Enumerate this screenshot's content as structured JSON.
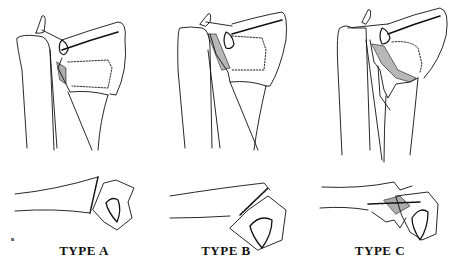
{
  "figure": {
    "panels": [
      {
        "id": "type-a",
        "label": "TYPE A"
      },
      {
        "id": "type-b",
        "label": "TYPE B"
      },
      {
        "id": "type-c",
        "label": "TYPE C"
      }
    ],
    "signature": "ʙ"
  },
  "colors": {
    "ink": "#111111",
    "background": "#ffffff"
  }
}
